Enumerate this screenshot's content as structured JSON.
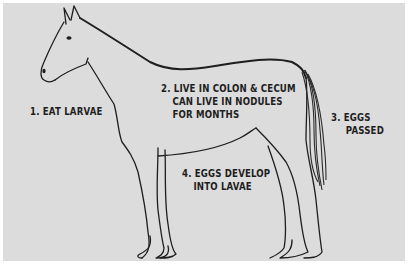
{
  "diagram": {
    "background_color": "#dcdcdc",
    "line_color": "#1e1e1e",
    "labels": [
      {
        "id": "step-1",
        "lines": [
          "1. EAT LARVAE"
        ]
      },
      {
        "id": "step-2",
        "lines": [
          "2. LIVE IN COLON & CECUM",
          "CAN LIVE IN NODULES",
          "FOR MONTHS"
        ]
      },
      {
        "id": "step-3",
        "lines": [
          "3. EGGS",
          "PASSED"
        ]
      },
      {
        "id": "step-4",
        "lines": [
          "4. EGGS DEVELOP",
          "INTO LAVAE"
        ]
      }
    ]
  }
}
